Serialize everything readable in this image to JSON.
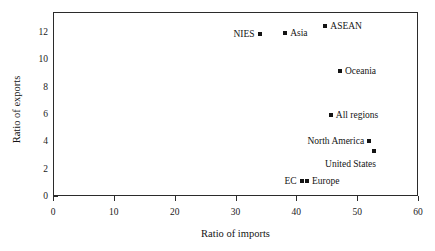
{
  "chart_data": {
    "type": "scatter",
    "title": "",
    "xlabel": "Ratio of imports",
    "ylabel": "Ratio of exports",
    "xlim": [
      0,
      60
    ],
    "ylim": [
      0,
      13.5
    ],
    "xticks": [
      0,
      10,
      20,
      30,
      40,
      50,
      60
    ],
    "xtick_labels": [
      "0",
      "10",
      "20",
      "30",
      "40",
      "50",
      "60"
    ],
    "yticks": [
      0,
      2,
      4,
      6,
      8,
      10,
      12
    ],
    "ytick_labels": [
      "0",
      "2",
      "4",
      "6",
      "8",
      "10",
      "12"
    ],
    "grid": false,
    "legend": "none",
    "marker": "square-dot",
    "marker_color": "#141414",
    "points": [
      {
        "label": "NIES",
        "x": 33.8,
        "y": 11.9,
        "label_side": "left"
      },
      {
        "label": "Asia",
        "x": 38.0,
        "y": 12.0,
        "label_side": "right"
      },
      {
        "label": "ASEAN",
        "x": 44.6,
        "y": 12.5,
        "label_side": "right"
      },
      {
        "label": "Oceania",
        "x": 47.0,
        "y": 9.2,
        "label_side": "right"
      },
      {
        "label": "All regions",
        "x": 45.5,
        "y": 6.0,
        "label_side": "right"
      },
      {
        "label": "North America",
        "x": 51.8,
        "y": 4.1,
        "label_side": "left"
      },
      {
        "label": "United States",
        "x": 52.6,
        "y": 3.4,
        "label_side": "left-below"
      },
      {
        "label": "EC",
        "x": 40.7,
        "y": 1.2,
        "label_side": "left"
      },
      {
        "label": "Europe",
        "x": 41.6,
        "y": 1.2,
        "label_side": "right"
      }
    ]
  },
  "axes": {
    "x_axis_label": "Ratio of imports",
    "y_axis_label": "Ratio of exports"
  }
}
